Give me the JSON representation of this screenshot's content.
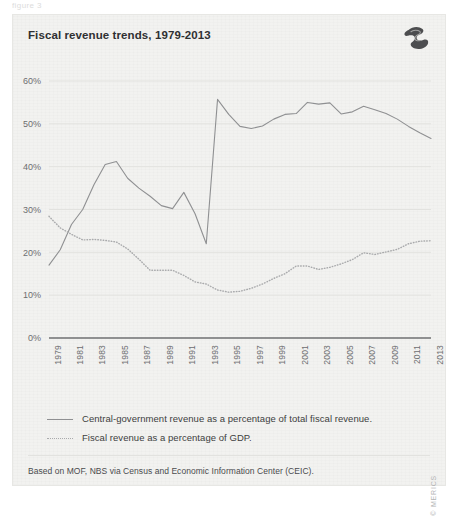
{
  "page": {
    "top_fragment": "figure 3",
    "copyright": "© MERICS"
  },
  "card": {
    "title": "Fiscal revenue trends, 1979-2013",
    "logo_name": "merics-logo",
    "source_note": "Based on MOF, NBS via Census and Economic Information Center (CEIC)."
  },
  "legend": {
    "items": [
      {
        "style": "solid",
        "label": "Central-government revenue as a percentage of total fiscal revenue."
      },
      {
        "style": "dotted",
        "label": "Fiscal revenue as a percentage of GDP."
      }
    ]
  },
  "chart_data": {
    "type": "line",
    "title": "Fiscal revenue trends, 1979-2013",
    "xlabel": "",
    "ylabel": "",
    "ylim": [
      0,
      60
    ],
    "xlim": [
      1979,
      2013
    ],
    "grid": true,
    "legend_position": "below",
    "ytick_labels": [
      "0%",
      "10%",
      "20%",
      "30%",
      "40%",
      "50%",
      "60%"
    ],
    "ytick_values": [
      0,
      10,
      20,
      30,
      40,
      50,
      60
    ],
    "xtick_labels": [
      "1979",
      "1981",
      "1983",
      "1985",
      "1987",
      "1989",
      "1991",
      "1993",
      "1995",
      "1997",
      "1999",
      "2001",
      "2003",
      "2005",
      "2007",
      "2009",
      "2011",
      "2013"
    ],
    "x": [
      1979,
      1980,
      1981,
      1982,
      1983,
      1984,
      1985,
      1986,
      1987,
      1988,
      1989,
      1990,
      1991,
      1992,
      1993,
      1994,
      1995,
      1996,
      1997,
      1998,
      1999,
      2000,
      2001,
      2002,
      2003,
      2004,
      2005,
      2006,
      2007,
      2008,
      2009,
      2010,
      2011,
      2012,
      2013
    ],
    "series": [
      {
        "name": "Central-government revenue as a percentage of total fiscal revenue.",
        "style": "solid",
        "color": "#8f9092",
        "values": [
          17.0,
          20.6,
          26.5,
          30.0,
          35.8,
          40.5,
          41.2,
          37.3,
          35.0,
          33.1,
          30.9,
          30.2,
          34.0,
          29.0,
          22.0,
          55.7,
          52.2,
          49.4,
          48.9,
          49.5,
          51.1,
          52.2,
          52.4,
          55.0,
          54.6,
          54.9,
          52.3,
          52.8,
          54.1,
          53.3,
          52.4,
          51.1,
          49.4,
          47.9,
          46.6
        ]
      },
      {
        "name": "Fiscal revenue as a percentage of GDP.",
        "style": "dotted",
        "color": "#a9aaac",
        "values": [
          28.4,
          25.7,
          24.2,
          22.9,
          23.0,
          22.8,
          22.4,
          20.8,
          18.4,
          15.8,
          15.8,
          15.8,
          14.6,
          13.1,
          12.6,
          11.2,
          10.7,
          10.9,
          11.6,
          12.6,
          13.9,
          15.0,
          16.8,
          16.8,
          16.0,
          16.5,
          17.3,
          18.3,
          19.9,
          19.5,
          20.1,
          20.7,
          22.0,
          22.6,
          22.7
        ]
      }
    ]
  }
}
